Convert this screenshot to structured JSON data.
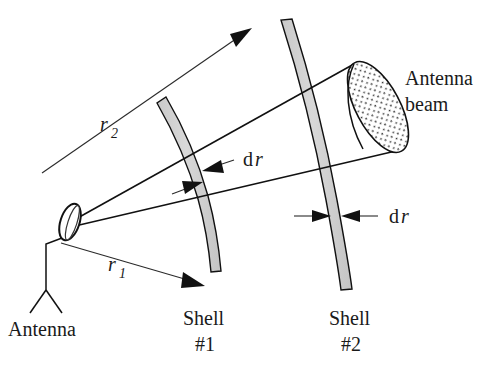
{
  "figure": {
    "background_color": "#ffffff",
    "line_color": "#111111",
    "shell_fill_color": "#d2d2d2",
    "text_color": "#1a1a1a"
  },
  "labels": {
    "antenna": "Antenna",
    "antenna_beam_line1": "Antenna",
    "antenna_beam_line2": "beam",
    "shell1_line1": "Shell",
    "shell1_line2": "#1",
    "shell2_line1": "Shell",
    "shell2_line2": "#2",
    "r1_symbol": "r",
    "r1_subscript": "1",
    "r2_symbol": "r",
    "r2_subscript": "2",
    "dr1_d": "d",
    "dr1_r": "r",
    "dr2_d": "d",
    "dr2_r": "r"
  },
  "elements": {
    "antenna_dish": "antenna-dish-ellipse",
    "antenna_stand": "antenna-tripod-stand",
    "shell1": "spherical-shell-1-arc-band",
    "shell2": "spherical-shell-2-arc-band",
    "beam_cone": "antenna-beam-cone",
    "beam_cap": "stippled-beam-cross-section",
    "r1_arrow": "radius-r1-arrow",
    "r2_arrow": "radius-r2-arrow",
    "dr1_arrows": "shell1-thickness-arrows",
    "dr2_arrows": "shell2-thickness-arrows"
  }
}
